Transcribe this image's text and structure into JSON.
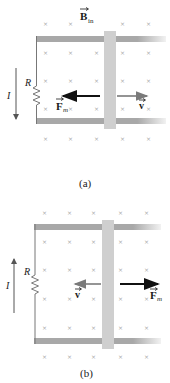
{
  "figure": {
    "field_label": "B",
    "field_subscript": "in",
    "panels": [
      {
        "id": "a",
        "caption": "(a)",
        "resistor_label": "R",
        "current_label": "I",
        "current_direction": "down",
        "force_label": "F",
        "force_subscript": "m",
        "force_direction": "left",
        "velocity_label": "v",
        "velocity_direction": "right"
      },
      {
        "id": "b",
        "caption": "(b)",
        "resistor_label": "R",
        "current_label": "I",
        "current_direction": "up",
        "force_label": "F",
        "force_subscript": "m",
        "force_direction": "right",
        "velocity_label": "v",
        "velocity_direction": "left"
      }
    ],
    "field_symbol": "×",
    "colors": {
      "rail": "#a8a8a8",
      "bar": "#cfcfcf",
      "force_arrow": "#111111",
      "velocity_arrow": "#7a7a7a",
      "field_marker": "#a9a9a9",
      "wire": "#777777"
    }
  }
}
